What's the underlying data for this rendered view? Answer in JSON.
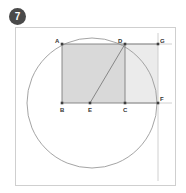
{
  "badge": {
    "number": "7",
    "shape": "filled-circle",
    "color": "#4a4a4a",
    "text_color": "#ffffff"
  },
  "figure": {
    "title": "",
    "frame_color": "#cfcfcf",
    "background": "#ffffff"
  },
  "chart_data": {
    "type": "diagram",
    "title": "",
    "colors": {
      "stroke": "#8a8a8a",
      "circle_stroke": "#9a9a9a",
      "rect_abcd_fill": "#d9d9d9",
      "rect_dcfg_fill": "#ebebeb",
      "point_fill": "#444444",
      "label_fill": "#333333"
    },
    "circle": {
      "center": [
        92,
        103
      ],
      "radius": 65,
      "filled": false
    },
    "points": [
      {
        "label": "A",
        "x": 62,
        "y": 44,
        "label_dx": -7,
        "label_dy": -1
      },
      {
        "label": "D",
        "x": 125,
        "y": 44,
        "label_dx": -7,
        "label_dy": -1
      },
      {
        "label": "G",
        "x": 158,
        "y": 44,
        "label_dx": 2,
        "label_dy": -1
      },
      {
        "label": "B",
        "x": 62,
        "y": 103,
        "label_dx": -2,
        "label_dy": 9
      },
      {
        "label": "E",
        "x": 90,
        "y": 103,
        "label_dx": -2,
        "label_dy": 9
      },
      {
        "label": "C",
        "x": 125,
        "y": 103,
        "label_dx": -2,
        "label_dy": 9
      },
      {
        "label": "F",
        "x": 158,
        "y": 103,
        "label_dx": 2,
        "label_dy": -2
      }
    ],
    "shapes": [
      {
        "name": "rectangle-abcd",
        "vertices": [
          "A",
          "B",
          "C",
          "D"
        ],
        "fill": "#d9d9d9"
      },
      {
        "name": "rectangle-dcfg",
        "vertices": [
          "D",
          "C",
          "F",
          "G"
        ],
        "fill": "#ebebeb"
      }
    ],
    "segments": [
      {
        "name": "segment-ab",
        "from": "A",
        "to": "B"
      },
      {
        "name": "segment-bc",
        "from": "B",
        "to": "C"
      },
      {
        "name": "segment-cd",
        "from": "C",
        "to": "D"
      },
      {
        "name": "segment-da",
        "from": "D",
        "to": "A"
      },
      {
        "name": "segment-dg",
        "from": "D",
        "to": "G"
      },
      {
        "name": "segment-cf",
        "from": "C",
        "to": "F"
      },
      {
        "name": "segment-ed",
        "from": "E",
        "to": "D"
      }
    ],
    "construction_lines": [
      {
        "name": "vertical-line-right",
        "x1": 158,
        "y1": 33,
        "x2": 158,
        "y2": 181
      },
      {
        "name": "horizontal-line-top",
        "x1": 125,
        "y1": 44,
        "x2": 172,
        "y2": 44
      },
      {
        "name": "horizontal-line-bottom",
        "x1": 125,
        "y1": 103,
        "x2": 172,
        "y2": 103
      }
    ]
  }
}
